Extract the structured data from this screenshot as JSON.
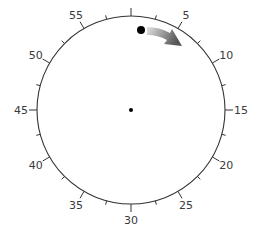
{
  "dial": {
    "center": [
      131,
      110
    ],
    "radius": 94,
    "stroke_color": "#333333",
    "labels": [
      {
        "minute": 5,
        "text": "5"
      },
      {
        "minute": 10,
        "text": "10"
      },
      {
        "minute": 15,
        "text": "15"
      },
      {
        "minute": 20,
        "text": "20"
      },
      {
        "minute": 25,
        "text": "25"
      },
      {
        "minute": 30,
        "text": "30"
      },
      {
        "minute": 35,
        "text": "35"
      },
      {
        "minute": 40,
        "text": "40"
      },
      {
        "minute": 45,
        "text": "45"
      },
      {
        "minute": 50,
        "text": "50"
      },
      {
        "minute": 55,
        "text": "55"
      }
    ],
    "major_tick_every": 5,
    "minor_tick_every": 2.5,
    "total_units": 60
  },
  "ball": {
    "x": 141,
    "y": 30,
    "r": 4,
    "color": "#000000"
  },
  "arrow": {
    "direction": "clockwise",
    "color_start": "#d6d6d6",
    "color_end": "#555555"
  },
  "center_dot": {
    "r": 2,
    "color": "#000000"
  }
}
